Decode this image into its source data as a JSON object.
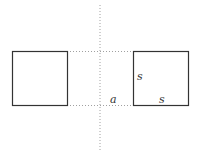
{
  "diagram": {
    "colors": {
      "square_stroke": "#333333",
      "dotted_line": "#999999",
      "label": "#333333"
    },
    "axis": {
      "x": 100,
      "y_start": 5,
      "y_end": 150
    },
    "left_square": {
      "x": 12,
      "y": 51,
      "size": 55
    },
    "right_square": {
      "x": 133,
      "y": 51,
      "size": 55
    },
    "labels": {
      "distance": "a",
      "side_vertical": "s",
      "side_horizontal": "s"
    }
  }
}
